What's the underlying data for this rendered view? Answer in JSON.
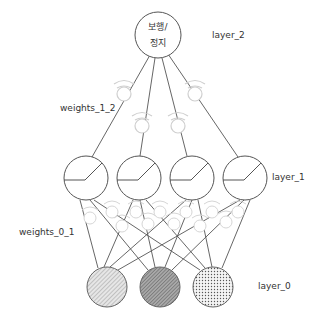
{
  "diagram": {
    "type": "neural-network",
    "labels": {
      "layer_2": "layer_2",
      "weights_1_2": "weights_1_2",
      "layer_1": "layer_1",
      "weights_0_1": "weights_0_1",
      "layer_0": "layer_0"
    },
    "output_node": {
      "line1": "보행/",
      "line2": "정지"
    },
    "layers": [
      {
        "name": "layer_0",
        "nodes": 3,
        "fills": [
          "hatched-light",
          "hatched-dark",
          "dotted"
        ]
      },
      {
        "name": "layer_1",
        "nodes": 4,
        "activation": "relu"
      },
      {
        "name": "layer_2",
        "nodes": 1
      }
    ],
    "colors": {
      "stroke": "#555555",
      "weight_icon": "#d8d8d8",
      "text": "#333333"
    }
  }
}
